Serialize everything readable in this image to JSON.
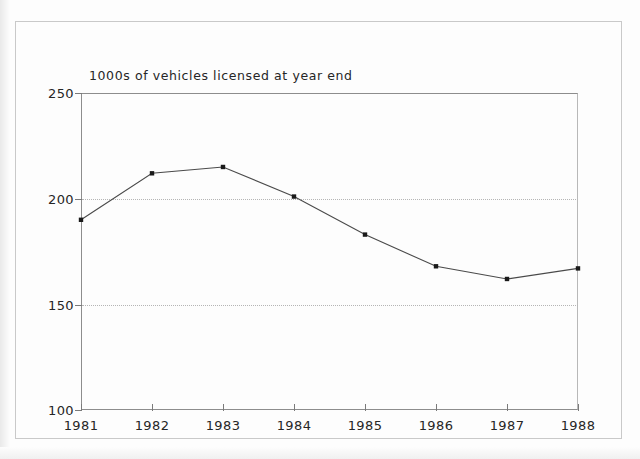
{
  "figure": {
    "title": "1000s of vehicles licensed at year end"
  },
  "chart_data": {
    "type": "line",
    "title": "1000s of vehicles licensed at year end",
    "xlabel": "",
    "ylabel": "",
    "categories": [
      "1981",
      "1982",
      "1983",
      "1984",
      "1985",
      "1986",
      "1987",
      "1988"
    ],
    "values": [
      190,
      212,
      215,
      201,
      183,
      168,
      162,
      167
    ],
    "series": [
      {
        "name": "1000s of vehicles licensed at year end",
        "values": [
          190,
          212,
          215,
          201,
          183,
          168,
          162,
          167
        ]
      }
    ],
    "ylim": [
      100,
      250
    ],
    "yticks": [
      "100",
      "150",
      "200",
      "250"
    ],
    "ytick_values": [
      100,
      150,
      200,
      250
    ],
    "xticks": [
      "1981",
      "1982",
      "1983",
      "1984",
      "1985",
      "1986",
      "1987",
      "1988"
    ],
    "grid": "horizontal-dotted-at-150-and-200",
    "legend": "none",
    "marker": "filled-square",
    "line_color": "#4a4a4a",
    "marker_color": "#1a1a1a",
    "grid_color": "#b5b5b5",
    "axis_color": "#8d8d8d"
  },
  "axis": {
    "y_labels": [
      "250",
      "200",
      "150",
      "100"
    ],
    "x_labels": [
      "1981",
      "1982",
      "1983",
      "1984",
      "1985",
      "1986",
      "1987",
      "1988"
    ]
  }
}
